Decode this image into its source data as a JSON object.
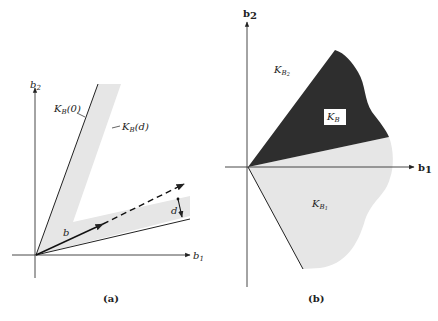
{
  "figure": {
    "panel_a": {
      "caption": "(a)",
      "axis_x_label": "b",
      "axis_x_sub": "1",
      "axis_y_label": "b",
      "axis_y_sub": "2",
      "label_kb0_main": "K",
      "label_kb0_sub": "B",
      "label_kb0_arg": "(0)",
      "label_kbd_main": "K",
      "label_kbd_sub": "B",
      "label_kbd_arg": "(d)",
      "vector_label": "b",
      "distance_label": "d"
    },
    "panel_b": {
      "caption": "(b)",
      "axis_x_label": "b",
      "axis_x_sub": "1",
      "axis_y_label": "b",
      "axis_y_sub": "2",
      "region_top_main": "K",
      "region_top_sub": "B",
      "region_top_subsub": "2",
      "region_dark_main": "K",
      "region_dark_sub": "B",
      "region_bottom_main": "K",
      "region_bottom_sub": "B",
      "region_bottom_subsub": "1"
    },
    "colors": {
      "shade_light": "#e6e6e6",
      "shade_dark": "#2e2e2e",
      "line": "#222222"
    }
  }
}
